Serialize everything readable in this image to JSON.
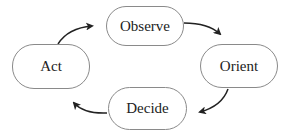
{
  "diagram": {
    "type": "cycle",
    "nodes": [
      {
        "id": "observe",
        "label": "Observe"
      },
      {
        "id": "orient",
        "label": "Orient"
      },
      {
        "id": "decide",
        "label": "Decide"
      },
      {
        "id": "act",
        "label": "Act"
      }
    ],
    "edges": [
      {
        "from": "observe",
        "to": "orient"
      },
      {
        "from": "orient",
        "to": "decide"
      },
      {
        "from": "decide",
        "to": "act"
      },
      {
        "from": "act",
        "to": "observe"
      }
    ],
    "colors": {
      "border": "#8a8a8a",
      "arrow": "#222222",
      "text": "#222222"
    }
  }
}
